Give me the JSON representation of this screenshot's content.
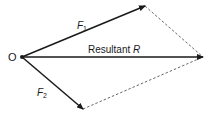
{
  "diagram": {
    "type": "vector-parallelogram",
    "colors": {
      "stroke": "#1a1a1a",
      "dashed": "#555555",
      "background": "#ffffff"
    },
    "origin": {
      "label": "O",
      "x": 22,
      "y": 57
    },
    "vectors": [
      {
        "id": "F1",
        "label": "F",
        "subscript": "1",
        "from": [
          22,
          57
        ],
        "to": [
          145,
          6
        ]
      },
      {
        "id": "R",
        "label": "Resultant ",
        "italic_part": "R",
        "from": [
          22,
          57
        ],
        "to": [
          203,
          57
        ]
      },
      {
        "id": "F2",
        "label": "F",
        "subscript": "2",
        "from": [
          22,
          57
        ],
        "to": [
          83,
          109
        ]
      }
    ],
    "construction_lines": [
      {
        "from": [
          145,
          6
        ],
        "to": [
          203,
          57
        ],
        "style": "dashed"
      },
      {
        "from": [
          83,
          109
        ],
        "to": [
          203,
          57
        ],
        "style": "dashed"
      }
    ]
  }
}
